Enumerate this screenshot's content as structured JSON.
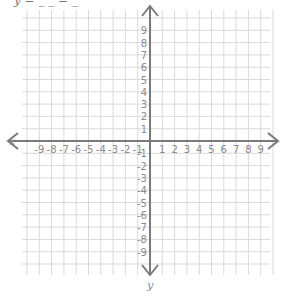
{
  "header_fragment": "y = _ _ = _",
  "plane": {
    "x_axis_label": "x",
    "y_axis_label": "y",
    "x_ticks": [
      "-9",
      "-8",
      "-7",
      "-6",
      "-5",
      "-4",
      "-3",
      "-2",
      "-1",
      "1",
      "2",
      "3",
      "4",
      "5",
      "6",
      "7",
      "8",
      "9"
    ],
    "y_ticks": [
      "9",
      "8",
      "7",
      "6",
      "5",
      "4",
      "3",
      "2",
      "1",
      "-1",
      "-2",
      "-3",
      "-4",
      "-5",
      "-6",
      "-7",
      "-8",
      "-9"
    ],
    "range": {
      "xmin": -9,
      "xmax": 9,
      "ymin": -9,
      "ymax": 9
    },
    "grid": true,
    "colors": {
      "grid": "#d9d9d9",
      "axis": "#7a7a7a",
      "labels": "#8a8a8a"
    }
  }
}
